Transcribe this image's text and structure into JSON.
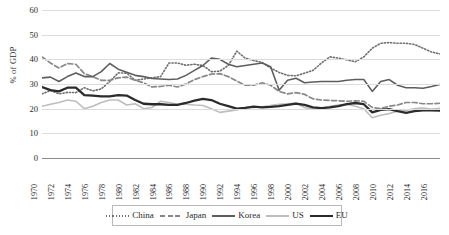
{
  "chart_data": {
    "type": "line",
    "title": "",
    "xlabel": "",
    "ylabel": "% of GDP",
    "ylim": [
      0,
      60
    ],
    "ytick_labels": [
      "0",
      "10",
      "20",
      "30",
      "40",
      "50",
      "60"
    ],
    "ytick_values": [
      0,
      10,
      20,
      30,
      40,
      50,
      60
    ],
    "grid": true,
    "legend_position": "bottom",
    "x": [
      1970,
      1971,
      1972,
      1973,
      1974,
      1975,
      1976,
      1977,
      1978,
      1979,
      1980,
      1981,
      1982,
      1983,
      1984,
      1985,
      1986,
      1987,
      1988,
      1989,
      1990,
      1991,
      1992,
      1993,
      1994,
      1995,
      1996,
      1997,
      1998,
      1999,
      2000,
      2001,
      2002,
      2003,
      2004,
      2005,
      2006,
      2007,
      2008,
      2009,
      2010,
      2011,
      2012,
      2013,
      2014,
      2015,
      2016,
      2017
    ],
    "xtick_labels": [
      "1970",
      "1972",
      "1974",
      "1976",
      "1978",
      "1980",
      "1982",
      "1984",
      "1986",
      "1988",
      "1990",
      "1992",
      "1994",
      "1996",
      "1998",
      "2000",
      "2002",
      "2004",
      "2006",
      "2008",
      "2010",
      "2012",
      "2014",
      "2016"
    ],
    "series": [
      {
        "name": "China",
        "style": "dotted",
        "color": "#6e6e6e",
        "width": 1.6,
        "values": [
          26.0,
          27.4,
          26.0,
          26.6,
          26.5,
          28.5,
          27.2,
          28.0,
          31.0,
          34.5,
          34.4,
          31.5,
          32.0,
          32.5,
          33.0,
          38.5,
          38.5,
          37.6,
          38.0,
          37.5,
          35.0,
          35.2,
          37.5,
          43.3,
          40.5,
          39.5,
          38.7,
          36.5,
          34.7,
          33.5,
          33.3,
          34.4,
          35.5,
          38.5,
          41.0,
          40.5,
          39.8,
          39.0,
          41.0,
          44.5,
          46.5,
          46.8,
          46.5,
          46.5,
          46.0,
          44.5,
          43.0,
          42.2
        ]
      },
      {
        "name": "Japan",
        "style": "dashed",
        "color": "#888888",
        "width": 1.7,
        "values": [
          41.0,
          38.5,
          36.5,
          38.3,
          38.0,
          34.2,
          33.0,
          31.5,
          31.5,
          32.5,
          32.8,
          31.5,
          30.5,
          28.8,
          29.0,
          29.5,
          28.8,
          30.0,
          31.8,
          33.0,
          34.0,
          34.2,
          33.0,
          31.2,
          29.5,
          29.5,
          30.5,
          29.5,
          27.0,
          26.0,
          26.5,
          25.8,
          24.0,
          23.5,
          23.3,
          23.2,
          23.0,
          23.2,
          23.0,
          20.5,
          20.0,
          21.0,
          21.5,
          22.5,
          22.5,
          22.0,
          22.0,
          22.2
        ]
      },
      {
        "name": "Korea",
        "style": "solid",
        "color": "#5e5e5e",
        "width": 1.6,
        "values": [
          32.5,
          32.8,
          31.0,
          33.0,
          34.5,
          33.0,
          33.0,
          35.0,
          38.3,
          36.0,
          34.8,
          33.5,
          33.0,
          32.2,
          32.0,
          31.8,
          32.0,
          33.5,
          35.5,
          37.5,
          40.5,
          40.0,
          38.0,
          37.0,
          37.5,
          38.0,
          38.5,
          37.0,
          27.5,
          31.5,
          32.3,
          30.5,
          30.8,
          31.0,
          31.0,
          31.0,
          31.5,
          31.8,
          31.8,
          27.0,
          31.0,
          31.8,
          29.5,
          28.5,
          28.5,
          28.3,
          29.0,
          29.8
        ]
      },
      {
        "name": "US",
        "style": "solid",
        "color": "#bdbdbd",
        "width": 1.6,
        "values": [
          21.0,
          21.8,
          22.5,
          23.5,
          23.0,
          20.0,
          21.0,
          22.5,
          23.5,
          23.5,
          21.5,
          22.0,
          20.0,
          20.5,
          23.0,
          22.5,
          21.8,
          21.8,
          21.5,
          21.3,
          20.0,
          18.5,
          19.0,
          19.5,
          20.5,
          20.5,
          20.8,
          21.3,
          21.8,
          22.0,
          22.3,
          20.5,
          19.8,
          20.0,
          21.0,
          21.5,
          21.8,
          21.0,
          20.0,
          16.3,
          17.3,
          18.0,
          19.0,
          19.3,
          20.0,
          20.3,
          19.8,
          20.2
        ]
      },
      {
        "name": "EU",
        "style": "solid-bold",
        "color": "#2b2b2b",
        "width": 2.3,
        "values": [
          28.8,
          27.5,
          27.0,
          28.5,
          28.5,
          25.5,
          25.3,
          25.0,
          25.0,
          25.5,
          25.3,
          23.5,
          22.0,
          21.8,
          21.8,
          21.5,
          21.5,
          22.3,
          23.3,
          24.0,
          23.5,
          22.0,
          21.0,
          20.0,
          20.3,
          20.8,
          20.5,
          20.7,
          21.0,
          21.5,
          22.0,
          21.5,
          20.5,
          20.2,
          20.5,
          21.0,
          21.8,
          22.3,
          21.8,
          18.5,
          19.5,
          19.8,
          19.0,
          18.3,
          19.0,
          19.3,
          19.3,
          19.2
        ]
      }
    ]
  },
  "legend": {
    "items": [
      {
        "label": "China"
      },
      {
        "label": "Japan"
      },
      {
        "label": "Korea"
      },
      {
        "label": "US"
      },
      {
        "label": "EU"
      }
    ]
  }
}
